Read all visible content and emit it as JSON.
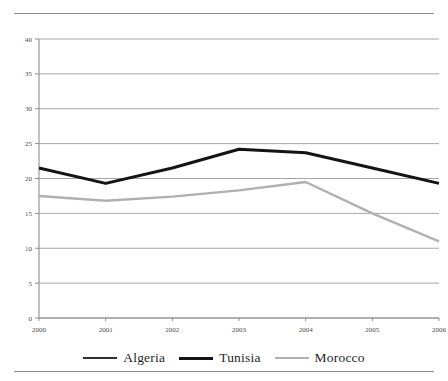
{
  "chart_data": {
    "type": "line",
    "title": "",
    "subtitle": "",
    "xlabel": "",
    "ylabel": "",
    "categories": [
      "2000",
      "2001",
      "2002",
      "2003",
      "2004",
      "2005",
      "2006"
    ],
    "xlim": [
      0,
      6
    ],
    "ylim": [
      0,
      40
    ],
    "yticks": [
      0,
      5,
      10,
      15,
      20,
      25,
      30,
      35,
      40
    ],
    "ytick_labels": [
      "0",
      "5",
      "10",
      "15",
      "20",
      "25",
      "30",
      "35",
      "40"
    ],
    "grid": true,
    "grid_axis": "y",
    "legend_position": "bottom",
    "series": [
      {
        "name": "Algeria",
        "color": "#2d2d2d",
        "line_width": 1.6,
        "values": [
          null,
          null,
          null,
          36.9,
          null,
          null,
          34.1
        ]
      },
      {
        "name": "Tunisia",
        "color": "#141414",
        "line_width": 3.0,
        "values": [
          21.5,
          19.3,
          21.5,
          24.2,
          23.7,
          21.5,
          19.3
        ]
      },
      {
        "name": "Morocco",
        "color": "#b0b0b0",
        "line_width": 2.4,
        "values": [
          17.5,
          16.8,
          17.4,
          18.3,
          19.5,
          15.0,
          11.0
        ]
      }
    ],
    "annotations": []
  },
  "legend": {
    "entries": [
      {
        "label": "Algeria"
      },
      {
        "label": "Tunisia"
      },
      {
        "label": "Morocco"
      }
    ]
  },
  "axes": {
    "y_tick_0": "0",
    "y_tick_1": "5",
    "y_tick_2": "10",
    "y_tick_3": "15",
    "y_tick_4": "20",
    "y_tick_5": "25",
    "y_tick_6": "30",
    "y_tick_7": "35",
    "y_tick_8": "40",
    "x_tick_0": "2000",
    "x_tick_1": "2001",
    "x_tick_2": "2002",
    "x_tick_3": "2003",
    "x_tick_4": "2004",
    "x_tick_5": "2005",
    "x_tick_6": "2006"
  },
  "colors": {
    "algeria": "#2d2d2d",
    "tunisia": "#141414",
    "morocco": "#b0b0b0",
    "grid": "#9c9c9c",
    "axis": "#8d8d8d",
    "rule": "#8a8a8a",
    "tick_text": "#4a4a4a"
  }
}
